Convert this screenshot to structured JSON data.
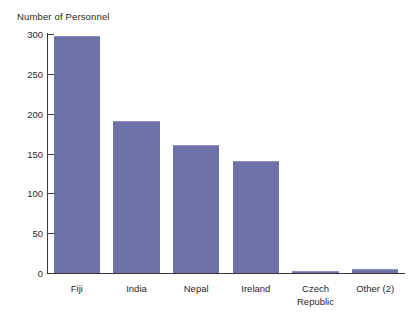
{
  "chart_data": {
    "type": "bar",
    "title": "",
    "ylabel": "Number of Personnel",
    "xlabel": "",
    "categories": [
      "Fiji",
      "India",
      "Nepal",
      "Ireland",
      "Czech Republic",
      "Other (2)"
    ],
    "values": [
      298,
      191,
      161,
      141,
      3,
      5
    ],
    "ylim": [
      0,
      300
    ],
    "yticks": [
      0,
      50,
      100,
      150,
      200,
      250,
      300
    ],
    "ytick_labels": [
      "0",
      "50",
      "100",
      "150",
      "200",
      "250",
      "300"
    ],
    "grid": false,
    "legend": null,
    "bar_color": "#6d72a9",
    "bar_edge_color": "#8d91bf",
    "axis_color": "#3b3739",
    "text_color": "#2a2628",
    "background": "#ffffff"
  },
  "axis": {
    "y_title": "Number of Personnel"
  },
  "category_display": [
    "Fiji",
    "India",
    "Nepal",
    "Ireland",
    "Czech\nRepublic",
    "Other (2)"
  ]
}
